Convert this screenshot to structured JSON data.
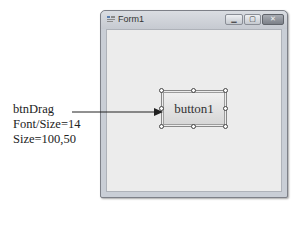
{
  "window": {
    "title": "Form1",
    "controls": {
      "minimize_glyph": "▁",
      "maximize_glyph": "▢",
      "close_glyph": "✕"
    }
  },
  "form": {
    "button": {
      "label": "button1",
      "selected": true
    }
  },
  "annotation": {
    "lines": [
      "btnDrag",
      "Font/Size=14",
      "Size=100,50"
    ],
    "arrow_target": "button1"
  },
  "colors": {
    "client_bg": "#ececec",
    "frame": "#c9ced6"
  }
}
